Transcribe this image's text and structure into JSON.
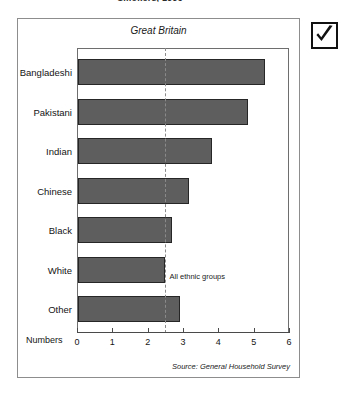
{
  "document": {
    "headline": "Smokers, 1996"
  },
  "widgets": {
    "checkbox": {
      "name": "checked-checkbox",
      "icon": "check-icon",
      "checked": true
    }
  },
  "chart_data": {
    "type": "bar",
    "orientation": "horizontal",
    "title": "Great Britain",
    "xlabel": "Numbers",
    "ylabel": "",
    "xlim": [
      0,
      6
    ],
    "xticks": [
      0,
      1,
      2,
      3,
      4,
      5,
      6
    ],
    "xtick_labels": [
      "0",
      "1",
      "2",
      "3",
      "4",
      "5",
      "6"
    ],
    "grid": false,
    "legend": "none",
    "categories": [
      "Bangladeshi",
      "Pakistani",
      "Indian",
      "Chinese",
      "Black",
      "White",
      "Other"
    ],
    "values": [
      5.3,
      4.8,
      3.8,
      3.15,
      2.65,
      2.45,
      2.9
    ],
    "bar_color": "#5e5e5e",
    "bar_edge_color": "#262626",
    "annotations": [
      {
        "label": "All ethnic groups",
        "type": "reference-line",
        "value": 2.45,
        "style": "dashed",
        "color": "#8a8a8a"
      }
    ],
    "source": "Source: General Household Survey"
  }
}
